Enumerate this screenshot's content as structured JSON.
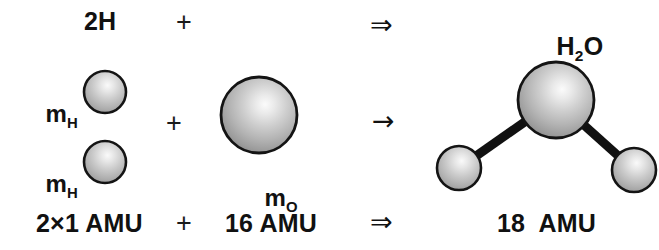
{
  "figure": {
    "background_color": "#ffffff",
    "width": 659,
    "height": 250
  },
  "labels": {
    "reactant_hydrogen_formula": "2H",
    "plus_top": "+",
    "arrow_top": "⇒",
    "product_formula_h": "H",
    "product_formula_sub": "2",
    "product_formula_o": "O",
    "mass_h_symbol": "m",
    "mass_h_subscript": "H",
    "mass_o_symbol": "m",
    "mass_o_subscript": "O",
    "plus_middle": "+",
    "arrow_middle": "→",
    "mass_hydrogen_value": "2×1 AMU",
    "plus_bottom": "+",
    "mass_oxygen_value": "16 AMU",
    "arrow_bottom": "⇒",
    "mass_water_value": "18  AMU"
  },
  "colors": {
    "sphere_outline": "#141414",
    "sphere_highlight": "#f2f2f2",
    "sphere_mid": "#b9b9b9",
    "sphere_edge": "#8a8a8a",
    "bond": "#111111",
    "text": "#111111"
  },
  "chart_data": {
    "type": "diagram",
    "equation_rows": [
      {
        "row": "formula",
        "left": "2H",
        "operator": "+",
        "right": "",
        "arrow": "⇒",
        "product": "H2O"
      },
      {
        "row": "pictorial",
        "left": "two hydrogen spheres (m_H, m_H)",
        "operator": "+",
        "right": "one oxygen sphere (m_O)",
        "arrow": "→",
        "product": "bent water molecule"
      },
      {
        "row": "mass",
        "left": "2×1 AMU",
        "operator": "+",
        "right": "16 AMU",
        "arrow": "⇒",
        "product": "18  AMU"
      }
    ],
    "atoms": [
      {
        "name": "hydrogen-reactant-top",
        "element": "H",
        "mass_amu": 1,
        "cx": 105,
        "cy": 92,
        "r": 21
      },
      {
        "name": "hydrogen-reactant-bottom",
        "element": "H",
        "mass_amu": 1,
        "cx": 105,
        "cy": 162,
        "r": 21
      },
      {
        "name": "oxygen-reactant",
        "element": "O",
        "mass_amu": 16,
        "cx": 259,
        "cy": 115,
        "r": 38
      },
      {
        "name": "oxygen-product",
        "element": "O",
        "mass_amu": 16,
        "cx": 556,
        "cy": 100,
        "r": 38
      },
      {
        "name": "hydrogen-product-left",
        "element": "H",
        "mass_amu": 1,
        "cx": 459,
        "cy": 168,
        "r": 22
      },
      {
        "name": "hydrogen-product-right",
        "element": "H",
        "mass_amu": 1,
        "cx": 634,
        "cy": 170,
        "r": 22
      }
    ],
    "bonds": [
      {
        "name": "bond-o-h-left",
        "from": "oxygen-product",
        "to": "hydrogen-product-left",
        "width": 9
      },
      {
        "name": "bond-o-h-right",
        "from": "oxygen-product",
        "to": "hydrogen-product-right",
        "width": 9
      }
    ]
  }
}
